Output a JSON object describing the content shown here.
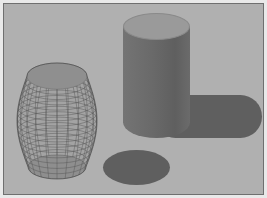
{
  "figure": {
    "canvas_width": 267,
    "canvas_height": 198,
    "background_color": "#b0b0b0",
    "outer_margin_color": "#e9e9e9",
    "border_color": "#6f6f6f"
  },
  "chart_data": {
    "type": "scatter",
    "title": "",
    "xlabel": "",
    "ylabel": "",
    "grid": false,
    "legend": "none",
    "render_style": "3d-surface",
    "objects": [
      {
        "name": "mesh-barrel",
        "label": "Wireframe barrel surface",
        "shading": "mesh",
        "mesh_color": "#5a5a5a",
        "face_color": "#a8a8a8",
        "cap_color": "#8f8f8f",
        "bbox": [
          11,
          55,
          84,
          125
        ],
        "mesh_rows": 17,
        "mesh_cols": 22
      },
      {
        "name": "solid-cylinder",
        "label": "Solid shaded cylinder",
        "shading": "flat",
        "top_color": "#9a9a9a",
        "body_color": "#6a6a6a",
        "bbox": [
          119,
          9,
          67,
          125
        ]
      },
      {
        "name": "cylinder-shadow",
        "label": "Cylinder cast shadow",
        "shape": "stadium",
        "color": "#5f5f5f",
        "bbox": [
          150,
          91,
          108,
          43
        ]
      },
      {
        "name": "barrel-shadow",
        "label": "Barrel cast shadow",
        "shape": "ellipse",
        "color": "#5f5f5f",
        "bbox": [
          99,
          146,
          67,
          35
        ]
      }
    ]
  }
}
